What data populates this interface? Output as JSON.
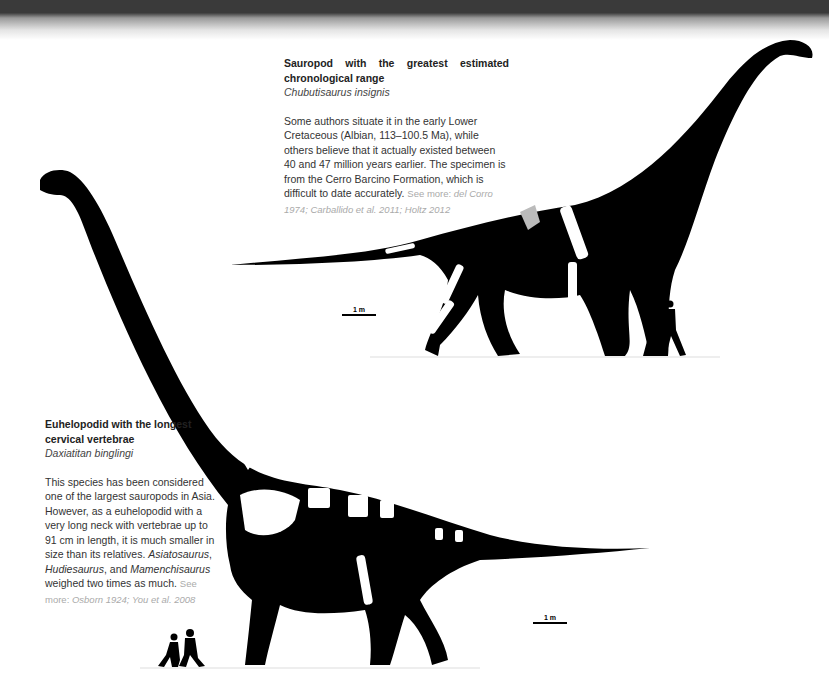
{
  "figures": [
    {
      "title": "Sauropod with the greatest estimated chronological range",
      "scientific_name": "Chubutisaurus insignis",
      "description": "Some authors situate it in the early Lower Cretaceous (Albian, 113–100.5 Ma), while others believe that it actually existed between 40 and 47 million years earlier. The specimen is from the Cerro Barcino Formation, which is difficult to date accurately.",
      "refs_label": "See more:",
      "refs": "del Corro 1974; Carballido et al. 2011; Holtz 2012",
      "scale_label": "1 m"
    },
    {
      "title": "Euhelopodid with the longest cervical vertebrae",
      "scientific_name": "Daxiatitan binglingi",
      "description_parts": {
        "a": "This species has been considered one of the largest sauropods in Asia. However, as a euhelopodid with a very long neck with vertebrae up to 91 cm in length, it is much smaller in size than its relatives. ",
        "genus1": "Asiatosaurus",
        "sep1": ", ",
        "genus2": "Hudiesaurus",
        "sep2": ", and ",
        "genus3": "Mamenchisaurus",
        "b": " weighed two times as much."
      },
      "refs_label": "See more:",
      "refs": "Osborn 1924; You et al. 2008",
      "scale_label": "1 m"
    }
  ],
  "colors": {
    "silhouette": "#000000",
    "bone": "#ffffff",
    "ref_text": "#aaaaaa",
    "ground": "#dddddd"
  }
}
